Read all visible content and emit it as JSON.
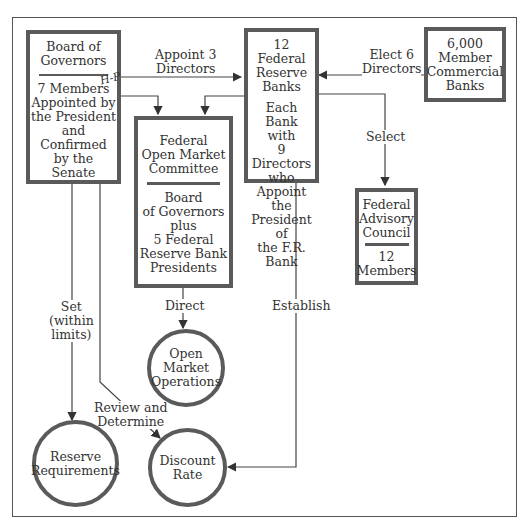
{
  "nodes": {
    "board": {
      "title": "Board of\nGovernors",
      "body": "7 Members\nAppointed by\nthe President\nand Confirmed\nby the Senate"
    },
    "frb": {
      "title": "12 Federal\nReserve Banks",
      "body": "Each Bank\nwith\n9 Directors\nwho\nAppoint the\nPresident of\nthe F.R. Bank"
    },
    "member_banks": {
      "title": "6,000\nMember\nCommercial\nBanks"
    },
    "fomc": {
      "title": "Federal\nOpen Market\nCommittee",
      "body": "Board\nof Governors\nplus\n5 Federal\nReserve Bank\nPresidents"
    },
    "fac": {
      "title": "Federal\nAdvisory\nCouncil",
      "body": "12\nMembers"
    },
    "omo": {
      "title": "Open\nMarket\nOperations"
    },
    "reserve_req": {
      "title": "Reserve\nRequirements"
    },
    "discount_rate": {
      "title": "Discount\nRate"
    }
  },
  "edges": {
    "appoint": "Appoint 3\nDirectors",
    "elect": "Elect 6\nDirectors",
    "select": "Select",
    "direct": "Direct",
    "establish": "Establish",
    "set": "Set\n(within\nlimits)",
    "review": "Review and\nDetermine"
  },
  "annotation": {
    "handwritten": "H-P"
  },
  "colors": {
    "stroke": "#5a5a5a",
    "text": "#333333"
  }
}
